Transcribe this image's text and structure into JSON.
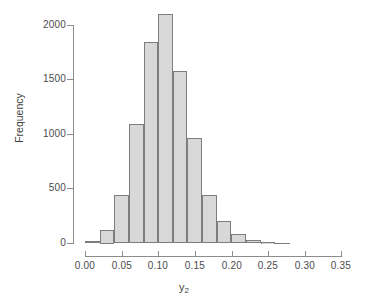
{
  "chart": {
    "type": "histogram",
    "xlabel_main": "y",
    "xlabel_sub": "2",
    "ylabel": "Frequency"
  },
  "axes": {
    "y_ticks": [
      "0",
      "500",
      "1000",
      "1500",
      "2000"
    ],
    "x_ticks": [
      "0.00",
      "0.05",
      "0.10",
      "0.15",
      "0.20",
      "0.25",
      "0.30",
      "0.35"
    ]
  },
  "chart_data": {
    "type": "bar",
    "title": "",
    "xlabel": "y2",
    "ylabel": "Frequency",
    "xlim": [
      0.0,
      0.35
    ],
    "ylim": [
      0,
      2100
    ],
    "grid": false,
    "legend": null,
    "bin_width": 0.02,
    "bin_edges": [
      0.0,
      0.02,
      0.04,
      0.06,
      0.08,
      0.1,
      0.12,
      0.14,
      0.16,
      0.18,
      0.2,
      0.22,
      0.24,
      0.26,
      0.28
    ],
    "categories": [
      "0.00-0.02",
      "0.02-0.04",
      "0.04-0.06",
      "0.06-0.08",
      "0.08-0.10",
      "0.10-0.12",
      "0.12-0.14",
      "0.14-0.16",
      "0.16-0.18",
      "0.18-0.20",
      "0.20-0.22",
      "0.22-0.24",
      "0.24-0.26",
      "0.26-0.28"
    ],
    "values": [
      25,
      125,
      440,
      1095,
      1840,
      2100,
      1575,
      970,
      445,
      205,
      85,
      30,
      10,
      5
    ],
    "x_tick_values": [
      0.0,
      0.05,
      0.1,
      0.15,
      0.2,
      0.25,
      0.3,
      0.35
    ],
    "y_tick_values": [
      0,
      500,
      1000,
      1500,
      2000
    ],
    "bar_fill_color": "#d8d8d8",
    "bar_edge_color": "#7d7d7d",
    "axis_color": "#8c8c8c",
    "background_color": "#ffffff"
  }
}
